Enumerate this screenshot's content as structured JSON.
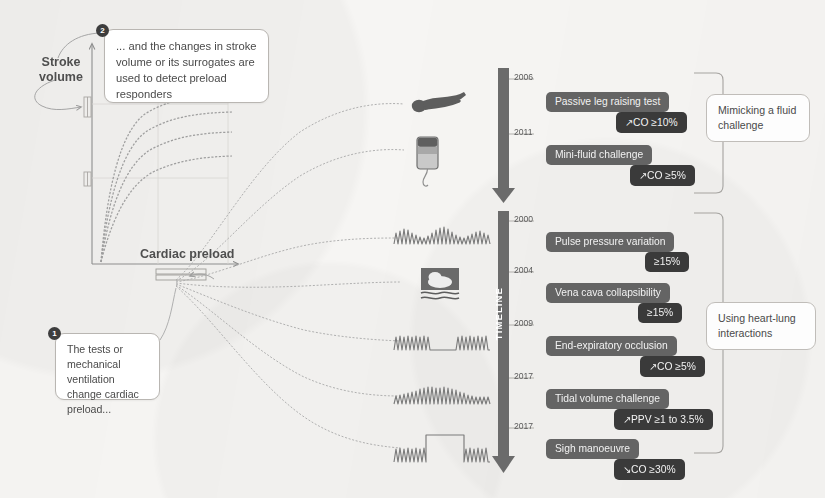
{
  "figure": {
    "background_color": "#f6f5f3"
  },
  "graph": {
    "y_axis_label": "Stroke\nvolume",
    "y_axis_label_line1": "Stroke",
    "y_axis_label_line2": "volume",
    "x_axis_label": "Cardiac preload",
    "curve_count": 4,
    "curve_color": "#9a9a9a"
  },
  "callouts": [
    {
      "id": "preload",
      "badge": "1",
      "text": "The tests or mechanical ventilation change cardiac preload..."
    },
    {
      "id": "stroke-volume",
      "badge": "2",
      "text": "... and the changes in stroke volume or its surrogates are used to detect preload responders"
    }
  ],
  "timeline": {
    "label": "TIMELINE",
    "arrow_color": "#6b6b6b",
    "segments": [
      {
        "id": "fluid-challenge",
        "group_label": "Mimicking a fluid challenge",
        "entries": [
          {
            "year": "2006",
            "name": "Passive leg raising test",
            "value": "↗CO ≥10%",
            "icon": "person-leg-raise-icon"
          },
          {
            "year": "2011",
            "name": "Mini-fluid challenge",
            "value": "↗CO ≥5%",
            "icon": "iv-fluid-bag-icon"
          }
        ]
      },
      {
        "id": "heart-lung",
        "group_label": "Using heart-lung interactions",
        "entries": [
          {
            "year": "2000",
            "name": "Pulse pressure variation",
            "value": "≥15%",
            "icon": "arterial-waveform-icon"
          },
          {
            "year": "2004",
            "name": "Vena cava collapsibility",
            "value": "≥15%",
            "icon": "ultrasound-image-icon"
          },
          {
            "year": "2009",
            "name": "End-expiratory occlusion",
            "value": "↗CO ≥5%",
            "icon": "occlusion-waveform-icon"
          },
          {
            "year": "2017",
            "name": "Tidal volume challenge",
            "value": "↗PPV ≥1 to 3.5%",
            "icon": "tidal-volume-waveform-icon"
          },
          {
            "year": "2017",
            "name": "Sigh manoeuvre",
            "value": "↘CO ≥30%",
            "icon": "sigh-waveform-icon"
          }
        ]
      }
    ]
  },
  "colors": {
    "name_box": "#646464",
    "value_box": "#3a3a3a",
    "text_on_dark": "#f2f2f2",
    "callout_border": "#b9b6b2",
    "line_gray": "#a5a5a5"
  }
}
